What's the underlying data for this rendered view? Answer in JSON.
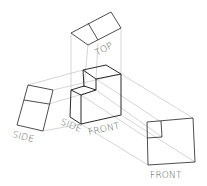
{
  "diagram": {
    "type": "orthographic-projection",
    "labels": {
      "top_view": "TOP",
      "side_view": "SIDE",
      "front_view": "FRONT",
      "object_side": "SIDE",
      "object_front": "FRONT"
    },
    "colors": {
      "edge": "#2a2a2a",
      "projection_line": "#b8b8b8",
      "label": "#555555",
      "background": "#ffffff"
    }
  }
}
